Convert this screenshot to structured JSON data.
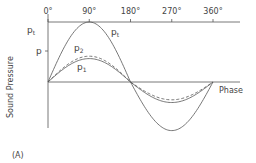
{
  "chart_data": {
    "type": "line",
    "title": "",
    "panel_label": "(A)",
    "xlabel": "Phase",
    "ylabel": "Sound Pressure",
    "x_ticks": [
      "0°",
      "90°",
      "180°",
      "270°",
      "360°"
    ],
    "x_tick_values": [
      0,
      90,
      180,
      270,
      360
    ],
    "xlim": [
      0,
      360
    ],
    "ylim": [
      -1,
      1
    ],
    "y_tick_labels": [
      {
        "label": "p",
        "sub": "t",
        "value": 1.0
      },
      {
        "label": "p",
        "sub": "",
        "value": 0.52
      }
    ],
    "grid": false,
    "legend": "inline labels",
    "series": [
      {
        "name": "pₜ",
        "label": "p",
        "sub": "t",
        "style": "solid",
        "amplitude": 1.0,
        "phase_deg": 0,
        "x": [
          0,
          45,
          90,
          135,
          180,
          225,
          270,
          315,
          360
        ],
        "values": [
          0,
          0.71,
          1.0,
          0.71,
          0,
          -0.71,
          -0.9,
          -0.64,
          0
        ]
      },
      {
        "name": "p₂",
        "label": "p",
        "sub": "2",
        "style": "dashed",
        "amplitude": 0.43,
        "phase_deg": 0,
        "x": [
          0,
          45,
          90,
          135,
          180,
          225,
          270,
          315,
          360
        ],
        "values": [
          0,
          0.3,
          0.43,
          0.3,
          0,
          -0.3,
          -0.33,
          -0.24,
          0
        ]
      },
      {
        "name": "p₁",
        "label": "p",
        "sub": "1",
        "style": "solid",
        "amplitude": 0.39,
        "phase_deg": 0,
        "x": [
          0,
          45,
          90,
          135,
          180,
          225,
          270,
          315,
          360
        ],
        "values": [
          0,
          0.28,
          0.39,
          0.28,
          0,
          -0.28,
          -0.38,
          -0.27,
          0
        ]
      }
    ],
    "annotations": [
      {
        "text": "p",
        "sub": "t",
        "near": "pₜ curve right of 90°"
      },
      {
        "text": "p",
        "sub": "2",
        "near": "above dashed curve"
      },
      {
        "text": "p",
        "sub": "1",
        "near": "below p₁ curve"
      }
    ]
  }
}
